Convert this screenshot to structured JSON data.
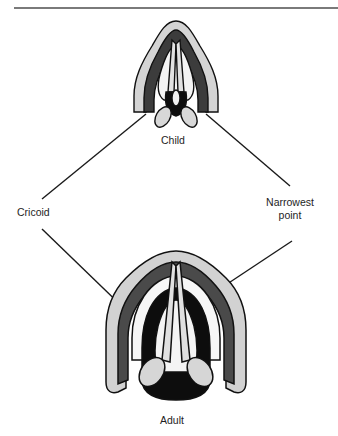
{
  "figure": {
    "type": "anatomical-diagram",
    "labels": {
      "child": "Child",
      "adult": "Adult",
      "cricoid": "Cricoid",
      "narrowest_line1": "Narrowest",
      "narrowest_line2": "point"
    },
    "colors": {
      "outline": "#1a1a1a",
      "dark_fill": "#3c3c3c",
      "mid_fill": "#8c8c8c",
      "light_fill": "#d6d6d6",
      "black": "#0d0d0d",
      "rule": "#7a7a7a"
    }
  }
}
